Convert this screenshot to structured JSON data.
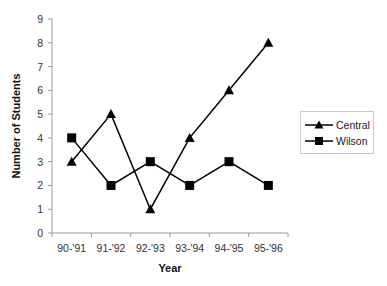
{
  "chart_data": {
    "type": "line",
    "title": "",
    "xlabel": "Year",
    "ylabel": "Number of Students",
    "categories": [
      "90-'91",
      "91-'92",
      "92-'93",
      "93-'94",
      "94-'95",
      "95-'96"
    ],
    "series": [
      {
        "name": "Central",
        "marker": "triangle",
        "color": "#000000",
        "values": [
          3,
          5,
          1,
          4,
          6,
          8
        ]
      },
      {
        "name": "Wilson",
        "marker": "square",
        "color": "#000000",
        "values": [
          4,
          2,
          3,
          2,
          3,
          2
        ]
      }
    ],
    "ylim": [
      0,
      9
    ],
    "yticks": [
      0,
      1,
      2,
      3,
      4,
      5,
      6,
      7,
      8,
      9
    ],
    "grid": false,
    "legend_position": "right"
  },
  "legend": {
    "items": [
      {
        "label": "Central",
        "marker": "triangle"
      },
      {
        "label": "Wilson",
        "marker": "square"
      }
    ]
  }
}
